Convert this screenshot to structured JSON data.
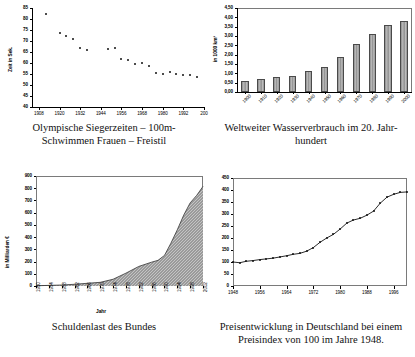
{
  "figures": [
    {
      "id": "olympia",
      "caption_line1": "Olympische Siegerzeiten – 100m-",
      "caption_line2": "Schwimmen Frauen – Freistil",
      "ylabel": "Zeit in Sek."
    },
    {
      "id": "wasser",
      "caption_line1": "Weltweiter Wasserverbrauch im 20. Jahr-",
      "caption_line2": "hundert",
      "ylabel": "in 1000 km³"
    },
    {
      "id": "schulden",
      "caption_line1": "Schuldenlast des Bundes",
      "caption_line2": "",
      "ylabel": "in Milliarden €",
      "xlabel": "Jahr"
    },
    {
      "id": "preise",
      "caption_line1": "Preisentwicklung in Deutschland bei einem",
      "caption_line2": "Preisindex von 100 im Jahre 1948.",
      "ylabel": ""
    }
  ],
  "chart_data": [
    {
      "type": "scatter",
      "id": "olympia",
      "title": "Olympische Siegerzeiten – 100m-Schwimmen Frauen – Freistil",
      "xlabel": "",
      "ylabel": "Zeit in Sek.",
      "xlim": [
        1904,
        2004
      ],
      "ylim": [
        40,
        85
      ],
      "yticks": [
        40,
        45,
        50,
        55,
        60,
        65,
        70,
        75,
        80,
        85
      ],
      "ytick_labels": [
        "40",
        "45",
        "50",
        "55",
        "60",
        "65",
        "70",
        "75",
        "80",
        "85"
      ],
      "xticks": [
        1908,
        1920,
        1932,
        1944,
        1956,
        1968,
        1980,
        1992,
        2004
      ],
      "xtick_labels": [
        "1908",
        "1920",
        "1932",
        "1944",
        "1956",
        "1968",
        "1980",
        "1992",
        "200"
      ],
      "grid": false,
      "x": [
        1912,
        1920,
        1924,
        1928,
        1932,
        1936,
        1948,
        1952,
        1956,
        1960,
        1964,
        1968,
        1972,
        1976,
        1980,
        1984,
        1988,
        1992,
        1996,
        2000
      ],
      "values": [
        82.2,
        73.6,
        72.4,
        71.0,
        66.8,
        65.9,
        66.3,
        66.8,
        62.0,
        61.2,
        59.5,
        60.0,
        58.6,
        55.65,
        54.79,
        55.92,
        54.93,
        54.64,
        54.5,
        53.8
      ]
    },
    {
      "type": "bar",
      "id": "wasser",
      "title": "Weltweiter Wasserverbrauch im 20. Jahrhundert",
      "xlabel": "",
      "ylabel": "in 1000 km³",
      "categories": [
        "1900",
        "1910",
        "1920",
        "1930",
        "1940",
        "1950",
        "1960",
        "1970",
        "1980",
        "1990",
        "2000"
      ],
      "values": [
        0.58,
        0.68,
        0.78,
        0.88,
        1.1,
        1.33,
        1.9,
        2.58,
        3.1,
        3.6,
        3.8
      ],
      "ylim": [
        0,
        4.5
      ],
      "yticks": [
        0,
        0.5,
        1.0,
        1.5,
        2.0,
        2.5,
        3.0,
        3.5,
        4.0,
        4.5
      ],
      "ytick_labels": [
        "0,00",
        "0,50",
        "1,00",
        "1,50",
        "2,00",
        "2,50",
        "3,00",
        "3,50",
        "4,00",
        "4,50"
      ],
      "grid": false
    },
    {
      "type": "area",
      "id": "schulden",
      "title": "Schuldenlast des Bundes",
      "xlabel": "Jahr",
      "ylabel": "in Milliarden €",
      "xlim": [
        1950,
        2002
      ],
      "ylim": [
        0,
        900
      ],
      "yticks": [
        0,
        100,
        200,
        300,
        400,
        500,
        600,
        700,
        800,
        900
      ],
      "ytick_labels": [
        "0",
        "100",
        "200",
        "300",
        "400",
        "500",
        "600",
        "700",
        "800",
        "900"
      ],
      "xticks": [
        1950,
        1954,
        1958,
        1962,
        1966,
        1970,
        1974,
        1978,
        1982,
        1986,
        1990,
        1994,
        1998,
        2002
      ],
      "xtick_labels": [
        "1950",
        "1954",
        "1958",
        "1962",
        "1966",
        "1970",
        "1974",
        "1978",
        "1982",
        "1986",
        "1990",
        "1994",
        "1998",
        "2002"
      ],
      "grid": false,
      "x": [
        1950,
        1954,
        1958,
        1962,
        1966,
        1970,
        1974,
        1978,
        1982,
        1986,
        1988,
        1990,
        1992,
        1994,
        1996,
        1998,
        2000,
        2002
      ],
      "values": [
        2,
        5,
        8,
        14,
        22,
        30,
        55,
        105,
        160,
        195,
        210,
        250,
        350,
        460,
        580,
        680,
        740,
        815
      ]
    },
    {
      "type": "line",
      "id": "preise",
      "title": "Preisentwicklung in Deutschland bei einem Preisindex von 100 im Jahre 1948.",
      "xlabel": "",
      "ylabel": "",
      "xlim": [
        1948,
        2000
      ],
      "ylim": [
        0,
        450
      ],
      "yticks": [
        0,
        50,
        100,
        150,
        200,
        250,
        300,
        350,
        400,
        450
      ],
      "ytick_labels": [
        "0",
        "50",
        "100",
        "150",
        "200",
        "250",
        "300",
        "350",
        "400",
        "450"
      ],
      "xticks": [
        1948,
        1956,
        1964,
        1972,
        1980,
        1988,
        1996
      ],
      "xtick_labels": [
        "1948",
        "1956",
        "1964",
        "1972",
        "1980",
        "1988",
        "1996"
      ],
      "grid": false,
      "x": [
        1948,
        1950,
        1952,
        1954,
        1956,
        1958,
        1960,
        1962,
        1964,
        1966,
        1968,
        1970,
        1972,
        1974,
        1976,
        1978,
        1980,
        1982,
        1984,
        1986,
        1988,
        1990,
        1992,
        1994,
        1996,
        1998,
        2000
      ],
      "values": [
        100,
        97,
        103,
        106,
        110,
        113,
        116,
        121,
        126,
        132,
        136,
        145,
        160,
        182,
        200,
        215,
        237,
        262,
        275,
        282,
        295,
        312,
        345,
        370,
        382,
        390,
        392
      ]
    }
  ]
}
